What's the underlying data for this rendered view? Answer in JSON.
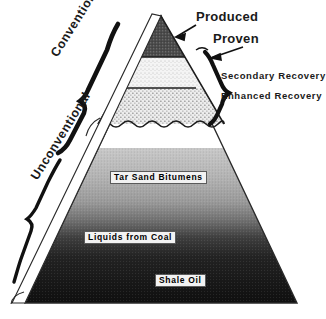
{
  "figure": {
    "type": "resource-pyramid-diagram",
    "background_color": "#ffffff"
  },
  "categories": {
    "conventional_label": "Conventional",
    "unconventional_label": "Unconventional"
  },
  "callouts": [
    {
      "name": "produced",
      "label": "Produced"
    },
    {
      "name": "proven",
      "label": "Proven"
    },
    {
      "name": "secondary-recovery",
      "label": "Secondary Recovery"
    },
    {
      "name": "enhanced-recovery",
      "label": "Enhanced Recovery"
    }
  ],
  "bands": [
    {
      "name": "produced",
      "label": "Produced",
      "fill": "#5c5c5c",
      "top": 18,
      "bottom": 57
    },
    {
      "name": "proven",
      "label": "Proven",
      "fill": "#f0f0f0",
      "top": 57,
      "bottom": 88
    },
    {
      "name": "enhanced",
      "label": "Enhanced Recovery",
      "fill": "#e8e8e8",
      "top": 88,
      "bottom": 124
    },
    {
      "name": "tar-sand-bitumens",
      "label": "Tar Sand Bitumens",
      "fill": "#b9b9b9",
      "top": 148,
      "bottom": 200
    },
    {
      "name": "liquids-from-coal",
      "label": "Liquids from Coal",
      "fill": "#3a3a3a",
      "top": 200,
      "bottom": 255
    },
    {
      "name": "shale-oil",
      "label": "Shale Oil",
      "fill": "#151515",
      "top": 255,
      "bottom": 303
    }
  ],
  "inner_labels": {
    "tar_sand": "Tar Sand Bitumens",
    "liquids_coal": "Liquids from Coal",
    "shale_oil": "Shale Oil"
  },
  "colors": {
    "ink": "#1a1a1a",
    "apex_gray": "#5c5c5c",
    "mid_gray": "#b9b9b9",
    "dark": "#151515",
    "paper": "#ffffff"
  }
}
